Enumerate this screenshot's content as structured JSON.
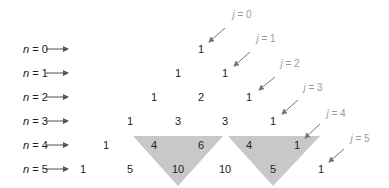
{
  "diagram": {
    "rows": [
      {
        "label_var": "n",
        "label_eq": " = 0",
        "values": [
          "1"
        ]
      },
      {
        "label_var": "n",
        "label_eq": " = 1",
        "values": [
          "1",
          "1"
        ]
      },
      {
        "label_var": "n",
        "label_eq": " = 2",
        "values": [
          "1",
          "2",
          "1"
        ]
      },
      {
        "label_var": "n",
        "label_eq": " = 3",
        "values": [
          "1",
          "3",
          "3",
          "1"
        ]
      },
      {
        "label_var": "n",
        "label_eq": " = 4",
        "values": [
          "1",
          "4",
          "6",
          "4",
          "1"
        ]
      },
      {
        "label_var": "n",
        "label_eq": " = 5",
        "values": [
          "1",
          "5",
          "10",
          "10",
          "5",
          "1"
        ]
      }
    ],
    "diagonals": [
      {
        "var": "j",
        "eq": " = 0"
      },
      {
        "var": "j",
        "eq": " = 1"
      },
      {
        "var": "j",
        "eq": " = 2"
      },
      {
        "var": "j",
        "eq": " = 3"
      },
      {
        "var": "j",
        "eq": " = 4"
      },
      {
        "var": "j",
        "eq": " = 5"
      }
    ],
    "highlights": [
      {
        "desc": "4 + 6 = 10",
        "color": "#c8c8c8"
      },
      {
        "desc": "4 + 1 = 5",
        "color": "#c8c8c8"
      }
    ],
    "colors": {
      "text": "#222222",
      "diagonal_label": "#9a9a9a",
      "arrow": "#555555",
      "highlight": "#c8c8c8"
    }
  }
}
